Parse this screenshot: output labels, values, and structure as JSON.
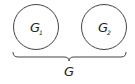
{
  "diagram": {
    "nodes": [
      {
        "id": "G1",
        "label": "G",
        "subscript": "1",
        "shape": "circle"
      },
      {
        "id": "G2",
        "label": "G",
        "subscript": "2",
        "shape": "circle"
      }
    ],
    "group": {
      "label": "G",
      "shape": "underbrace",
      "contains": [
        "G1",
        "G2"
      ]
    },
    "colors": {
      "stroke": "#444444",
      "background": "#ffffff"
    }
  }
}
